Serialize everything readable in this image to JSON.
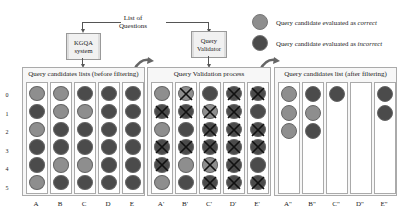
{
  "source": {
    "label": "List of Questions",
    "line1": "List of",
    "line2": "Questions"
  },
  "boxes": {
    "kgqa": {
      "line1": "KGQA",
      "line2": "system"
    },
    "validator": {
      "line1": "Query",
      "line2": "Validator"
    }
  },
  "legend": {
    "correct": {
      "prefix": "Query candidate evaluated as ",
      "emphasis": "correct",
      "color": "#8e8e8e"
    },
    "incorrect": {
      "prefix": "Query candidate evaluated as ",
      "emphasis": "incorrect",
      "color": "#4b4b4b"
    }
  },
  "row_labels": [
    "0",
    "1",
    "2",
    "3",
    "4",
    "5"
  ],
  "panels": [
    {
      "title": "Query candidates lists (before filtering)",
      "columns": [
        {
          "label": "A",
          "items": [
            [
              "c",
              0
            ],
            [
              "i",
              0
            ],
            [
              "c",
              0
            ],
            [
              "i",
              0
            ],
            [
              "i",
              0
            ],
            [
              "c",
              0
            ]
          ]
        },
        {
          "label": "B",
          "items": [
            [
              "c",
              0
            ],
            [
              "c",
              0
            ],
            [
              "i",
              0
            ],
            [
              "i",
              0
            ],
            [
              "c",
              0
            ],
            [
              "i",
              0
            ]
          ]
        },
        {
          "label": "C",
          "items": [
            [
              "i",
              0
            ],
            [
              "c",
              0
            ],
            [
              "i",
              0
            ],
            [
              "i",
              0
            ],
            [
              "c",
              0
            ],
            [
              "i",
              0
            ]
          ]
        },
        {
          "label": "D",
          "items": [
            [
              "i",
              0
            ],
            [
              "i",
              0
            ],
            [
              "i",
              0
            ],
            [
              "i",
              0
            ],
            [
              "i",
              0
            ],
            [
              "i",
              0
            ]
          ]
        },
        {
          "label": "E",
          "items": [
            [
              "i",
              0
            ],
            [
              "i",
              0
            ],
            [
              "i",
              0
            ],
            [
              "i",
              0
            ],
            [
              "i",
              0
            ],
            [
              "i",
              0
            ]
          ]
        }
      ]
    },
    {
      "title": "Query Validation process",
      "columns": [
        {
          "label": "A'",
          "items": [
            [
              "c",
              0
            ],
            [
              "i",
              1
            ],
            [
              "c",
              0
            ],
            [
              "i",
              1
            ],
            [
              "i",
              1
            ],
            [
              "c",
              0
            ]
          ]
        },
        {
          "label": "B'",
          "items": [
            [
              "c",
              1
            ],
            [
              "i",
              1
            ],
            [
              "i",
              0
            ],
            [
              "i",
              1
            ],
            [
              "c",
              0
            ],
            [
              "i",
              0
            ]
          ]
        },
        {
          "label": "C'",
          "items": [
            [
              "i",
              0
            ],
            [
              "c",
              1
            ],
            [
              "i",
              1
            ],
            [
              "i",
              1
            ],
            [
              "c",
              1
            ],
            [
              "i",
              1
            ]
          ]
        },
        {
          "label": "D'",
          "items": [
            [
              "i",
              1
            ],
            [
              "i",
              1
            ],
            [
              "i",
              1
            ],
            [
              "i",
              1
            ],
            [
              "i",
              1
            ],
            [
              "i",
              1
            ]
          ]
        },
        {
          "label": "E'",
          "items": [
            [
              "i",
              1
            ],
            [
              "i",
              0
            ],
            [
              "i",
              1
            ],
            [
              "i",
              1
            ],
            [
              "i",
              0
            ],
            [
              "i",
              1
            ]
          ]
        }
      ]
    },
    {
      "title": "Query candidates list (after filtering)",
      "columns": [
        {
          "label": "A\"",
          "items": [
            [
              "c",
              0
            ],
            [
              "c",
              0
            ],
            [
              "c",
              0
            ]
          ]
        },
        {
          "label": "B\"",
          "items": [
            [
              "i",
              0
            ],
            [
              "c",
              0
            ],
            [
              "i",
              0
            ]
          ]
        },
        {
          "label": "C\"",
          "items": [
            [
              "i",
              0
            ]
          ]
        },
        {
          "label": "D\"",
          "items": []
        },
        {
          "label": "E\"",
          "items": [
            [
              "i",
              0
            ],
            [
              "i",
              0
            ]
          ]
        }
      ]
    }
  ]
}
